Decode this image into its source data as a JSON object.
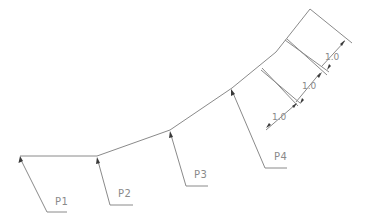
{
  "diagram": {
    "type": "cad-polyline-with-leaders",
    "points": [
      {
        "label": "P1"
      },
      {
        "label": "P2"
      },
      {
        "label": "P3"
      },
      {
        "label": "P4"
      }
    ],
    "dimensions": [
      {
        "value": "1.0"
      },
      {
        "value": "1.0"
      },
      {
        "value": "1.0"
      }
    ],
    "colors": {
      "line": "#8a8a8a",
      "arrow": "#3a3a3a",
      "background": "#ffffff"
    }
  }
}
